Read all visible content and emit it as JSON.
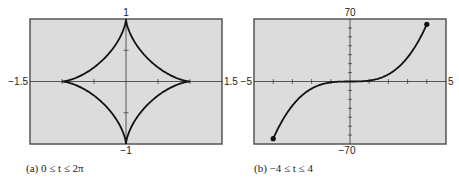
{
  "chart_data": [
    {
      "type": "line",
      "panel": "a",
      "caption": "(a) 0 ≤ t ≤ 2π",
      "curve": "astroid x = cos³t, y = sin³t",
      "xlim": [
        -1.5,
        1.5
      ],
      "ylim": [
        -1,
        1
      ],
      "x_tick_labels": {
        "left": "−1.5",
        "right": "1.5"
      },
      "y_tick_labels": {
        "top": "1",
        "bottom": "−1"
      },
      "x_ticks": [
        -1,
        -0.5,
        0.5,
        1
      ],
      "y_ticks": [
        -0.5,
        0.5
      ],
      "grid": false,
      "key_points": [
        {
          "x": 1,
          "y": 0
        },
        {
          "x": 0,
          "y": 1
        },
        {
          "x": -1,
          "y": 0
        },
        {
          "x": 0,
          "y": -1
        }
      ]
    },
    {
      "type": "line",
      "panel": "b",
      "caption": "(b) −4 ≤ t ≤ 4",
      "curve": "x = t, y = t³",
      "xlim": [
        -5,
        5
      ],
      "ylim": [
        -70,
        70
      ],
      "x_tick_labels": {
        "left": "−5",
        "right": "5"
      },
      "y_tick_labels": {
        "top": "70",
        "bottom": "−70"
      },
      "x_ticks": [
        -4,
        -3,
        -2,
        -1,
        1,
        2,
        3,
        4
      ],
      "y_ticks": [
        -60,
        -50,
        -40,
        -30,
        -20,
        -10,
        10,
        20,
        30,
        40,
        50,
        60
      ],
      "grid": false,
      "endpoints": [
        {
          "x": -4,
          "y": -64
        },
        {
          "x": 4,
          "y": 64
        }
      ]
    }
  ],
  "panels": {
    "a": {
      "caption": "(a) 0 ≤ t ≤ 2π",
      "x_min_label": "−1.5",
      "x_max_label": "1.5",
      "y_max_label": "1",
      "y_min_label": "−1"
    },
    "b": {
      "caption": "(b) −4 ≤ t ≤ 4",
      "x_min_label": "−5",
      "x_max_label": "5",
      "y_max_label": "70",
      "y_min_label": "−70"
    }
  },
  "colors": {
    "plot_bg": "#dcdcdc",
    "frame": "#555555",
    "curve": "#111111",
    "axis": "#333333"
  }
}
